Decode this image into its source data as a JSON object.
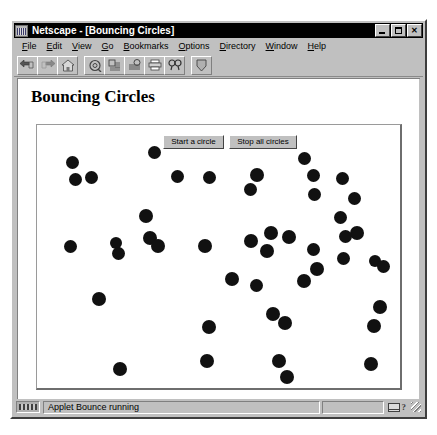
{
  "window": {
    "title": "Netscape - [Bouncing Circles]",
    "icon": "netscape-app-icon",
    "controls": {
      "minimize": "_",
      "maximize": "□",
      "close": "✕"
    }
  },
  "menu": {
    "items": [
      {
        "label": "File",
        "mnemonic": "F"
      },
      {
        "label": "Edit",
        "mnemonic": "E"
      },
      {
        "label": "View",
        "mnemonic": "V"
      },
      {
        "label": "Go",
        "mnemonic": "G"
      },
      {
        "label": "Bookmarks",
        "mnemonic": "B"
      },
      {
        "label": "Options",
        "mnemonic": "O"
      },
      {
        "label": "Directory",
        "mnemonic": "D"
      },
      {
        "label": "Window",
        "mnemonic": "W"
      },
      {
        "label": "Help",
        "mnemonic": "H"
      }
    ]
  },
  "toolbar": {
    "buttons": [
      {
        "name": "back-icon",
        "tooltip": "Back"
      },
      {
        "name": "forward-icon",
        "tooltip": "Forward"
      },
      {
        "name": "home-icon",
        "tooltip": "Home"
      },
      {
        "name": "reload-icon",
        "tooltip": "Reload"
      },
      {
        "name": "images-icon",
        "tooltip": "Images"
      },
      {
        "name": "open-icon",
        "tooltip": "Open"
      },
      {
        "name": "print-icon",
        "tooltip": "Print"
      },
      {
        "name": "find-icon",
        "tooltip": "Find"
      },
      {
        "name": "stop-icon",
        "tooltip": "Stop"
      }
    ]
  },
  "page": {
    "heading": "Bouncing Circles"
  },
  "applet": {
    "name": "Bounce",
    "buttons": {
      "start": "Start a circle",
      "stop": "Stop all circles"
    },
    "circle_color": "#111111",
    "background_color": "#ffffff",
    "circle_count": 46,
    "circles": [
      {
        "x": 27,
        "y": 29,
        "d": 13
      },
      {
        "x": 109,
        "y": 19,
        "d": 13
      },
      {
        "x": 30,
        "y": 46,
        "d": 13
      },
      {
        "x": 46,
        "y": 44,
        "d": 13
      },
      {
        "x": 132,
        "y": 43,
        "d": 13
      },
      {
        "x": 164,
        "y": 44,
        "d": 13
      },
      {
        "x": 211,
        "y": 41,
        "d": 14
      },
      {
        "x": 205,
        "y": 56,
        "d": 13
      },
      {
        "x": 259,
        "y": 25,
        "d": 13
      },
      {
        "x": 268,
        "y": 42,
        "d": 13
      },
      {
        "x": 269,
        "y": 61,
        "d": 13
      },
      {
        "x": 297,
        "y": 45,
        "d": 13
      },
      {
        "x": 309,
        "y": 65,
        "d": 13
      },
      {
        "x": 100,
        "y": 82,
        "d": 14
      },
      {
        "x": 225,
        "y": 99,
        "d": 14
      },
      {
        "x": 311,
        "y": 99,
        "d": 14
      },
      {
        "x": 25,
        "y": 113,
        "d": 13
      },
      {
        "x": 71,
        "y": 110,
        "d": 12
      },
      {
        "x": 73,
        "y": 120,
        "d": 13
      },
      {
        "x": 104,
        "y": 104,
        "d": 14
      },
      {
        "x": 112,
        "y": 112,
        "d": 14
      },
      {
        "x": 159,
        "y": 112,
        "d": 14
      },
      {
        "x": 205,
        "y": 107,
        "d": 14
      },
      {
        "x": 221,
        "y": 117,
        "d": 14
      },
      {
        "x": 243,
        "y": 103,
        "d": 14
      },
      {
        "x": 298,
        "y": 125,
        "d": 13
      },
      {
        "x": 330,
        "y": 128,
        "d": 12
      },
      {
        "x": 338,
        "y": 133,
        "d": 13
      },
      {
        "x": 271,
        "y": 135,
        "d": 14
      },
      {
        "x": 258,
        "y": 147,
        "d": 14
      },
      {
        "x": 186,
        "y": 145,
        "d": 14
      },
      {
        "x": 211,
        "y": 152,
        "d": 13
      },
      {
        "x": 53,
        "y": 165,
        "d": 14
      },
      {
        "x": 227,
        "y": 180,
        "d": 14
      },
      {
        "x": 239,
        "y": 189,
        "d": 14
      },
      {
        "x": 334,
        "y": 173,
        "d": 14
      },
      {
        "x": 328,
        "y": 192,
        "d": 14
      },
      {
        "x": 163,
        "y": 193,
        "d": 14
      },
      {
        "x": 161,
        "y": 227,
        "d": 14
      },
      {
        "x": 74,
        "y": 235,
        "d": 14
      },
      {
        "x": 233,
        "y": 227,
        "d": 14
      },
      {
        "x": 241,
        "y": 243,
        "d": 14
      },
      {
        "x": 325,
        "y": 230,
        "d": 14
      },
      {
        "x": 300,
        "y": 103,
        "d": 13
      },
      {
        "x": 295,
        "y": 84,
        "d": 13
      },
      {
        "x": 268,
        "y": 116,
        "d": 13
      }
    ]
  },
  "status": {
    "message": "Applet Bounce running",
    "icons": [
      "mail-icon",
      "question-icon",
      "resize-grip"
    ]
  }
}
